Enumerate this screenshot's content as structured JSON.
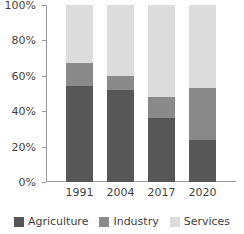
{
  "chart_data": {
    "type": "bar",
    "stacked": true,
    "title": "",
    "subtitle": "",
    "xlabel": "",
    "ylabel": "",
    "categories": [
      "1991",
      "2004",
      "2017",
      "2020"
    ],
    "series": [
      {
        "name": "Agriculture",
        "color": "#575757",
        "values": [
          54,
          52,
          36,
          24
        ]
      },
      {
        "name": "Industry",
        "color": "#8a8a8a",
        "values": [
          13,
          8,
          12,
          29
        ]
      },
      {
        "name": "Services",
        "color": "#dcdcdc",
        "values": [
          33,
          40,
          52,
          47
        ]
      }
    ],
    "ylim": [
      0,
      100
    ],
    "y_ticks": [
      0,
      20,
      40,
      60,
      80,
      100
    ],
    "y_tick_labels": [
      "0%",
      "20%",
      "40%",
      "60%",
      "80%",
      "100%"
    ],
    "grid": false,
    "legend_position": "bottom",
    "value_unit": "%",
    "cumulative_tops": {
      "1991": {
        "agriculture_top": 54,
        "industry_top": 67,
        "services_top": 100
      },
      "2004": {
        "agriculture_top": 52,
        "industry_top": 60,
        "services_top": 100
      },
      "2017": {
        "agriculture_top": 36,
        "industry_top": 48,
        "services_top": 100
      },
      "2020": {
        "agriculture_top": 24,
        "industry_top": 53,
        "services_top": 100
      }
    }
  },
  "axis": {
    "y_labels": [
      "100%",
      "80%",
      "60%",
      "40%",
      "20%",
      "0%"
    ]
  },
  "x_axis": {
    "labels": [
      "1991",
      "2004",
      "2017",
      "2020"
    ]
  },
  "legend": {
    "items": [
      {
        "label": "Agriculture",
        "color": "#575757",
        "swatch": "square-swatch"
      },
      {
        "label": "Industry",
        "color": "#8a8a8a",
        "swatch": "square-swatch"
      },
      {
        "label": "Services",
        "color": "#dcdcdc",
        "swatch": "square-swatch"
      }
    ]
  }
}
